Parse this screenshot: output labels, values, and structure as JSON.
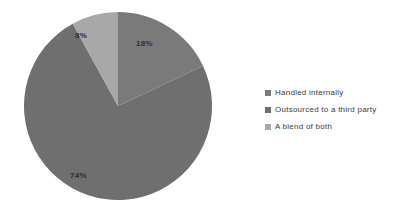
{
  "chart_data": {
    "type": "pie",
    "title": "",
    "categories": [
      "Handled internally",
      "Outsourced to a third party",
      "A blend of both"
    ],
    "values": [
      18,
      74,
      8
    ],
    "value_labels": [
      "18%",
      "74%",
      "8%"
    ],
    "units": "percent",
    "start_angle_deg": 0,
    "direction": "clockwise",
    "legend_position": "right",
    "grid": false,
    "colors": [
      "#7a7a7a",
      "#6f6f6f",
      "#a8a8a8"
    ],
    "label_text_color": "#2e2e2e",
    "background": "#ffffff"
  },
  "legend": {
    "items": [
      {
        "label": "Handled internally",
        "color": "#7a7a7a",
        "value_label": "18%"
      },
      {
        "label": "Outsourced to a third party",
        "color": "#6f6f6f",
        "value_label": "74%"
      },
      {
        "label": "A blend of both",
        "color": "#a8a8a8",
        "value_label": "8%"
      }
    ]
  },
  "slices": [
    {
      "name": "handled-internally",
      "label": "18%"
    },
    {
      "name": "outsourced-third-party",
      "label": "74%"
    },
    {
      "name": "blend-of-both",
      "label": "8%"
    }
  ]
}
